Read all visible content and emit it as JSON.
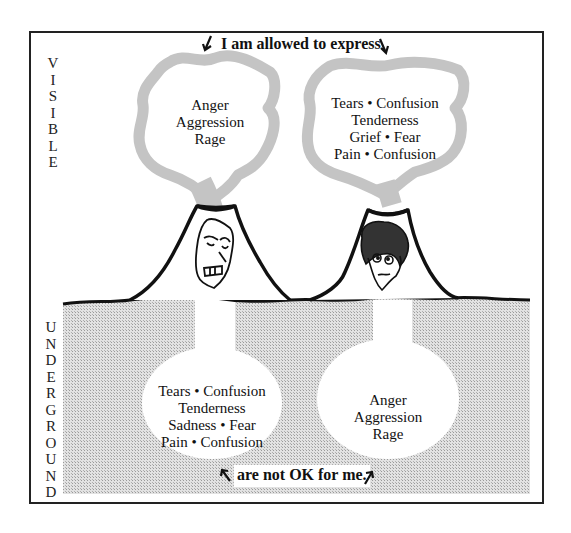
{
  "diagram": {
    "top_caption": "I am allowed to express",
    "bottom_caption": "are not OK for me.",
    "side_labels": {
      "visible": [
        "V",
        "I",
        "S",
        "I",
        "B",
        "L",
        "E"
      ],
      "underground": [
        "U",
        "N",
        "D",
        "E",
        "R",
        "G",
        "R",
        "O",
        "U",
        "N",
        "D"
      ]
    },
    "volcanoes": [
      {
        "name": "angry-volcano",
        "face": "angry-face",
        "visible_emotions": [
          "Anger",
          "Aggression",
          "Rage"
        ],
        "underground_emotions": [
          "Tears • Confusion",
          "Tenderness",
          "Sadness • Fear",
          "Pain • Confusion"
        ]
      },
      {
        "name": "sad-volcano",
        "face": "worried-face",
        "visible_emotions": [
          "Tears • Confusion",
          "Tenderness",
          "Grief • Fear",
          "Pain • Confusion"
        ],
        "underground_emotions": [
          "Anger",
          "Aggression",
          "Rage"
        ]
      }
    ],
    "colors": {
      "smoke": "#c4c4c4",
      "underground_fill": "#d0d0d0",
      "line": "#111111",
      "frame": "#222222"
    }
  }
}
